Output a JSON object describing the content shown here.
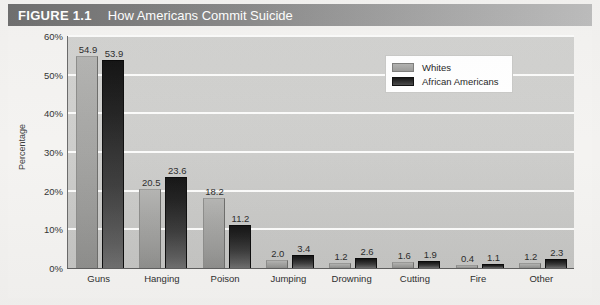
{
  "figure": {
    "number_label": "FIGURE 1.1",
    "title": "How Americans Commit Suicide"
  },
  "legend": {
    "position": "top-right",
    "entries": [
      {
        "label": "Whites",
        "color": "#a4a4a2",
        "swatch": "whites-swatch"
      },
      {
        "label": "African Americans",
        "color": "#1a1a1a",
        "swatch": "african-americans-swatch"
      }
    ]
  },
  "chart_data": {
    "type": "bar",
    "title": "How Americans Commit Suicide",
    "xlabel": "",
    "ylabel": "Percentage",
    "ylim": [
      0,
      60
    ],
    "ytick_labels": [
      "0%",
      "10%",
      "20%",
      "30%",
      "40%",
      "50%",
      "60%"
    ],
    "ytick_values": [
      0,
      10,
      20,
      30,
      40,
      50,
      60
    ],
    "grid": true,
    "legend_position": "top-right",
    "categories": [
      "Guns",
      "Hanging",
      "Poison",
      "Jumping",
      "Drowning",
      "Cutting",
      "Fire",
      "Other"
    ],
    "series": [
      {
        "name": "Whites",
        "color": "#a4a4a2",
        "values": [
          54.9,
          20.5,
          18.2,
          2.0,
          1.2,
          1.6,
          0.4,
          1.2
        ],
        "labels": [
          "54.9",
          "20.5",
          "18.2",
          "2.0",
          "1.2",
          "1.6",
          "0.4",
          "1.2"
        ]
      },
      {
        "name": "African Americans",
        "color": "#1a1a1a",
        "values": [
          53.9,
          23.6,
          11.2,
          3.4,
          2.6,
          1.9,
          1.1,
          2.3
        ],
        "labels": [
          "53.9",
          "23.6",
          "11.2",
          "3.4",
          "2.6",
          "1.9",
          "1.1",
          "2.3"
        ]
      }
    ]
  },
  "colors": {
    "title_bar_start": "#6f6f6f",
    "title_bar_end": "#bdbdbd",
    "plot_background": "#cfcfcd",
    "gridline": "#fbfbfa",
    "page_background": "#f3f2f0"
  }
}
